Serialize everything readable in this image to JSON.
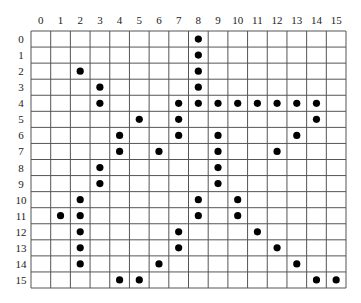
{
  "grid": {
    "columns": [
      "0",
      "1",
      "2",
      "3",
      "4",
      "5",
      "6",
      "7",
      "8",
      "9",
      "10",
      "11",
      "12",
      "13",
      "14",
      "15"
    ],
    "rows": [
      "0",
      "1",
      "2",
      "3",
      "4",
      "5",
      "6",
      "7",
      "8",
      "9",
      "10",
      "11",
      "12",
      "13",
      "14",
      "15"
    ],
    "marked_cells_by_row": [
      {
        "row": 0,
        "cols": [
          8
        ]
      },
      {
        "row": 1,
        "cols": [
          8
        ]
      },
      {
        "row": 2,
        "cols": [
          2,
          8
        ]
      },
      {
        "row": 3,
        "cols": [
          3,
          8
        ]
      },
      {
        "row": 4,
        "cols": [
          3,
          7,
          8,
          9,
          10,
          11,
          12,
          13,
          14
        ]
      },
      {
        "row": 5,
        "cols": [
          5,
          7,
          14
        ]
      },
      {
        "row": 6,
        "cols": [
          4,
          7,
          9,
          13
        ]
      },
      {
        "row": 7,
        "cols": [
          4,
          6,
          9,
          12
        ]
      },
      {
        "row": 8,
        "cols": [
          3,
          9
        ]
      },
      {
        "row": 9,
        "cols": [
          3,
          9
        ]
      },
      {
        "row": 10,
        "cols": [
          2,
          8,
          10
        ]
      },
      {
        "row": 11,
        "cols": [
          1,
          2,
          8,
          10
        ]
      },
      {
        "row": 12,
        "cols": [
          2,
          7,
          11
        ]
      },
      {
        "row": 13,
        "cols": [
          2,
          7,
          12
        ]
      },
      {
        "row": 14,
        "cols": [
          2,
          6,
          13
        ]
      },
      {
        "row": 15,
        "cols": [
          4,
          5,
          14,
          15
        ]
      }
    ],
    "dot_color": "#000000",
    "line_color": "#555555"
  }
}
